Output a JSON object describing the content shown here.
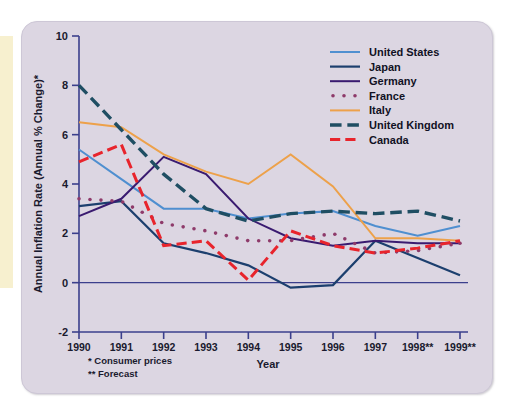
{
  "figure": {
    "panel_bg": "#dcd6e2",
    "accent_strip": "#f7f0cf",
    "axis_color": "#3b3f8c",
    "text_color": "#1a1a2e"
  },
  "chart_data": {
    "type": "line",
    "title": "",
    "xlabel": "Year",
    "ylabel": "Annual Inflation Rate (Annual % Change)*",
    "categories": [
      "1990",
      "1991",
      "1992",
      "1993",
      "1994",
      "1995",
      "1996",
      "1997",
      "1998**",
      "1999**"
    ],
    "ylim": [
      -2,
      10
    ],
    "yticks": [
      -2,
      0,
      2,
      4,
      6,
      8,
      10
    ],
    "ytick_labels": [
      "-2",
      "0",
      "2",
      "4",
      "6",
      "8",
      "10"
    ],
    "grid": false,
    "legend_position": "top-right",
    "zero_line": 0,
    "series": [
      {
        "name": "United States",
        "color": "#4f8fd0",
        "style": "solid",
        "width": 2.0,
        "values": [
          5.4,
          4.2,
          3.0,
          3.0,
          2.6,
          2.8,
          2.9,
          2.3,
          1.9,
          2.3
        ]
      },
      {
        "name": "Japan",
        "color": "#1c3f6e",
        "style": "solid",
        "width": 2.2,
        "values": [
          3.1,
          3.3,
          1.6,
          1.2,
          0.7,
          -0.2,
          -0.1,
          1.7,
          1.0,
          0.3
        ]
      },
      {
        "name": "Germany",
        "color": "#3a1b70",
        "style": "solid",
        "width": 2.0,
        "values": [
          2.7,
          3.4,
          5.1,
          4.4,
          2.6,
          1.8,
          1.5,
          1.7,
          1.6,
          1.6
        ]
      },
      {
        "name": "France",
        "color": "#8e3a6a",
        "style": "dotted",
        "width": 3.6,
        "values": [
          3.4,
          3.3,
          2.4,
          2.1,
          1.7,
          1.7,
          2.0,
          1.2,
          1.3,
          1.6
        ]
      },
      {
        "name": "Italy",
        "color": "#eda14a",
        "style": "solid",
        "width": 2.0,
        "values": [
          6.5,
          6.3,
          5.2,
          4.5,
          4.0,
          5.2,
          3.9,
          1.8,
          1.8,
          1.7
        ]
      },
      {
        "name": "United Kingdom",
        "color": "#1f4e63",
        "style": "dashed",
        "width": 3.4,
        "values": [
          8.0,
          6.2,
          4.4,
          3.0,
          2.5,
          2.8,
          2.9,
          2.8,
          2.9,
          2.5
        ]
      },
      {
        "name": "Canada",
        "color": "#e8242c",
        "style": "dashed",
        "width": 3.0,
        "values": [
          4.9,
          5.6,
          1.5,
          1.7,
          0.1,
          2.1,
          1.5,
          1.2,
          1.4,
          1.7
        ]
      }
    ],
    "footnotes": [
      "* Consumer prices",
      "** Forecast"
    ]
  }
}
